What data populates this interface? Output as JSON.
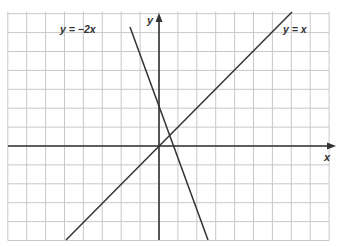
{
  "chart_data": {
    "type": "line",
    "title": "",
    "xlabel": "x",
    "ylabel": "y",
    "grid": true,
    "xlim": [
      -8,
      9
    ],
    "ylim": [
      -5,
      7
    ],
    "series": [
      {
        "name": "y = x",
        "label": "y = x",
        "slope": 1,
        "x": [
          -5,
          7
        ],
        "y": [
          -5,
          7
        ]
      },
      {
        "name": "y = −2x",
        "label": "y = −2x",
        "slope": -2,
        "x": [
          -1.5,
          2.5
        ],
        "y": [
          3,
          -5
        ]
      }
    ],
    "annotations": [
      {
        "text": "y = −2x",
        "position": "upper-left, at top end of y=−2x line"
      },
      {
        "text": "y = x",
        "position": "upper-right, near top end of y=x line"
      }
    ]
  },
  "labels": {
    "x_axis": "x",
    "y_axis": "y",
    "line1": "y = x",
    "line2": "y = −2x"
  },
  "colors": {
    "grid": "#c8c8c8",
    "axis": "#333333",
    "line": "#333333",
    "background": "#ffffff"
  }
}
